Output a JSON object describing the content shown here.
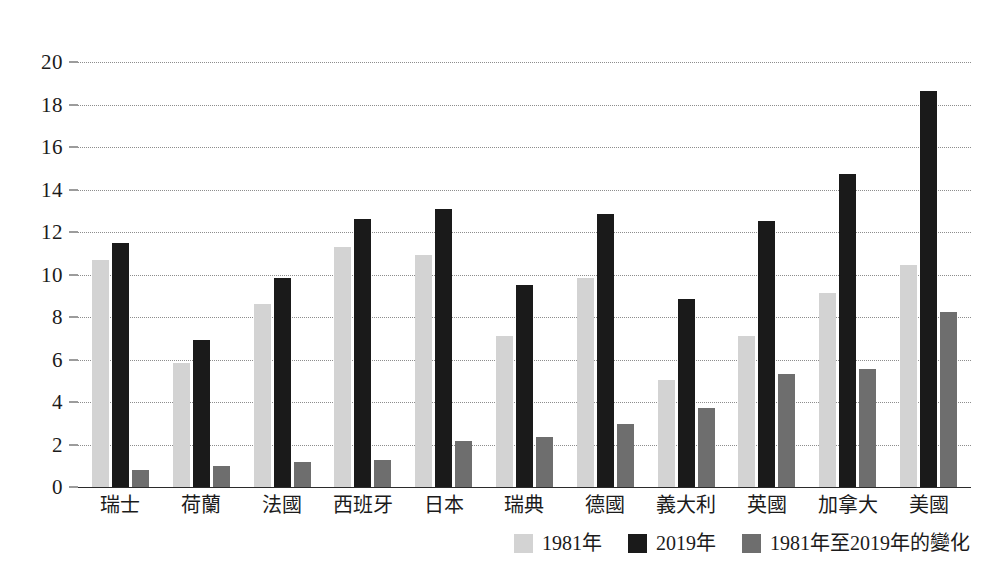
{
  "chart_data": {
    "type": "bar",
    "title": "",
    "subtitle": "",
    "xlabel": "",
    "ylabel": "",
    "ylim": [
      0,
      20
    ],
    "ytick_step": 2,
    "yticks": [
      20,
      18,
      16,
      14,
      12,
      10,
      8,
      6,
      4,
      2,
      0
    ],
    "grid": true,
    "legend_position": "bottom-right",
    "categories": [
      "瑞士",
      "荷蘭",
      "法國",
      "西班牙",
      "日本",
      "瑞典",
      "德國",
      "義大利",
      "英國",
      "加拿大",
      "美國"
    ],
    "series": [
      {
        "name": "1981年",
        "color": "#d3d3d3",
        "values": [
          10.7,
          5.85,
          8.6,
          11.3,
          10.9,
          7.1,
          9.85,
          5.05,
          7.1,
          9.15,
          10.45
        ]
      },
      {
        "name": "2019年",
        "color": "#1a1a1a",
        "values": [
          11.5,
          6.9,
          9.85,
          12.6,
          13.1,
          9.5,
          12.85,
          8.85,
          12.5,
          14.75,
          18.65
        ]
      },
      {
        "name": "1981年至2019年的變化",
        "color": "#6e6e6e",
        "values": [
          0.8,
          1.0,
          1.2,
          1.25,
          2.15,
          2.35,
          2.95,
          3.7,
          5.3,
          5.55,
          8.25
        ]
      }
    ]
  },
  "top_sliver_text": "",
  "colors": {
    "series_1981": "#d3d3d3",
    "series_2019": "#1a1a1a",
    "series_change": "#6e6e6e",
    "gridline": "#8d8d8d",
    "axis": "#2b2b2b",
    "text": "#1b1b1b",
    "background": "#ffffff"
  }
}
